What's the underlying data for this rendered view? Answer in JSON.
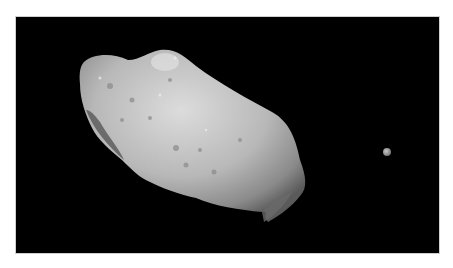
{
  "image": {
    "description": "Grayscale photograph of an elongated cratered asteroid against black space with a small moon to the right",
    "subjects": [
      {
        "name": "asteroid",
        "position": "center-left"
      },
      {
        "name": "moon",
        "position": "right"
      }
    ],
    "colors": {
      "background": "#000000",
      "page": "#ffffff",
      "surface_light": "#d8d8d8",
      "surface_mid": "#a8a8a8",
      "surface_dark": "#5a5a5a"
    }
  }
}
